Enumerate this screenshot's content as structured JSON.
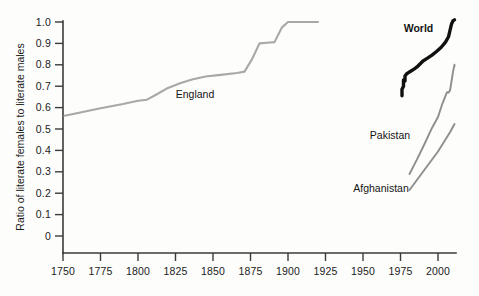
{
  "chart_data": {
    "type": "line",
    "title": "",
    "subtitle": "",
    "xlabel": "",
    "ylabel": "Ratio of literate females to literate males",
    "xlim": [
      1743,
      2020
    ],
    "ylim": [
      0,
      1.0
    ],
    "grid": false,
    "legend_position": "inline-labels",
    "xticks": [
      1750,
      1775,
      1800,
      1825,
      1850,
      1875,
      1900,
      1925,
      1950,
      1975,
      2000
    ],
    "xtick_labels": [
      "1750",
      "1775",
      "1800",
      "1825",
      "1850",
      "1875",
      "1900",
      "1925",
      "1950",
      "1975",
      "2000"
    ],
    "yticks": [
      0,
      0.1,
      0.2,
      0.3,
      0.4,
      0.5,
      0.6,
      0.7,
      0.8,
      0.9,
      1.0
    ],
    "ytick_labels": [
      "0",
      "0.1",
      "0.2",
      "0.3",
      "0.4",
      "0.5",
      "0.6",
      "0.7",
      "0.8",
      "0.9",
      "1.0"
    ],
    "series": [
      {
        "name": "England",
        "color": "#a8a8a8",
        "width": 2.1,
        "bold_label": false,
        "label_x": 1838,
        "label_y": 0.645,
        "points": [
          [
            1751,
            0.562
          ],
          [
            1760,
            0.575
          ],
          [
            1775,
            0.597
          ],
          [
            1790,
            0.617
          ],
          [
            1800,
            0.632
          ],
          [
            1806,
            0.637
          ],
          [
            1812,
            0.66
          ],
          [
            1820,
            0.692
          ],
          [
            1828,
            0.714
          ],
          [
            1836,
            0.731
          ],
          [
            1845,
            0.745
          ],
          [
            1855,
            0.753
          ],
          [
            1866,
            0.762
          ],
          [
            1871,
            0.768
          ],
          [
            1876,
            0.826
          ],
          [
            1881,
            0.9
          ],
          [
            1886,
            0.903
          ],
          [
            1891,
            0.906
          ],
          [
            1896,
            0.975
          ],
          [
            1900,
            1.0
          ],
          [
            1910,
            1.0
          ],
          [
            1920,
            1.0
          ]
        ]
      },
      {
        "name": "World",
        "color": "#111111",
        "width": 3.4,
        "bold_label": true,
        "label_x": 1987,
        "label_y": 0.955,
        "points": [
          [
            1976,
            0.655
          ],
          [
            1976,
            0.686
          ],
          [
            1977,
            0.7
          ],
          [
            1977,
            0.729
          ],
          [
            1978,
            0.724
          ],
          [
            1978,
            0.748
          ],
          [
            1979,
            0.757
          ],
          [
            1980,
            0.762
          ],
          [
            1982,
            0.771
          ],
          [
            1984,
            0.78
          ],
          [
            1986,
            0.79
          ],
          [
            1988,
            0.804
          ],
          [
            1990,
            0.818
          ],
          [
            1993,
            0.831
          ],
          [
            1996,
            0.845
          ],
          [
            1999,
            0.862
          ],
          [
            2002,
            0.881
          ],
          [
            2005,
            0.906
          ],
          [
            2007,
            0.931
          ],
          [
            2008,
            0.961
          ],
          [
            2009,
            0.99
          ],
          [
            2010,
            1.006
          ],
          [
            2011,
            1.01
          ]
        ]
      },
      {
        "name": "Pakistan",
        "color": "#8e8e8e",
        "width": 1.9,
        "bold_label": false,
        "label_x": 1968,
        "label_y": 0.452,
        "points": [
          [
            1981,
            0.29
          ],
          [
            1986,
            0.358
          ],
          [
            1991,
            0.43
          ],
          [
            1996,
            0.505
          ],
          [
            2000,
            0.556
          ],
          [
            2003,
            0.62
          ],
          [
            2005,
            0.655
          ],
          [
            2006,
            0.672
          ],
          [
            2007,
            0.67
          ],
          [
            2008,
            0.68
          ],
          [
            2009,
            0.722
          ],
          [
            2010,
            0.767
          ],
          [
            2011,
            0.8
          ],
          [
            2011,
            0.793
          ]
        ]
      },
      {
        "name": "Afghanistan",
        "color": "#8e8e8e",
        "width": 1.9,
        "bold_label": false,
        "label_x": 1962,
        "label_y": 0.205,
        "points": [
          [
            1981,
            0.215
          ],
          [
            1990,
            0.3
          ],
          [
            2000,
            0.395
          ],
          [
            2008,
            0.485
          ],
          [
            2011,
            0.523
          ]
        ]
      }
    ]
  },
  "axes": {
    "ylabel": "Ratio of literate females to literate males"
  }
}
